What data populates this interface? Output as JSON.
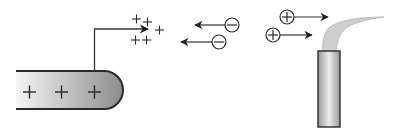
{
  "diagram": {
    "colors": {
      "background": "#ffffff",
      "stroke": "#2a2a2a",
      "rod_gradient_light": "#f4f4f4",
      "rod_gradient_dark": "#8c8c8c",
      "tube_light": "#e6e6e6",
      "tube_dark": "#9a9a9a",
      "plume_fill": "#cfcfcf"
    },
    "electrode": {
      "label": "charged electrode",
      "charges": [
        "+",
        "+",
        "+"
      ]
    },
    "emitted_charges": {
      "label": "positive charge cluster",
      "symbols": [
        "+",
        "+",
        "+",
        "+",
        "+",
        "+"
      ]
    },
    "negative_ions": [
      {
        "symbol": "−",
        "direction": "left"
      },
      {
        "symbol": "−",
        "direction": "left"
      }
    ],
    "positive_ions": [
      {
        "symbol": "+",
        "direction": "right"
      },
      {
        "symbol": "+",
        "direction": "right"
      }
    ],
    "emitter": {
      "label": "emitter tube with plume"
    }
  }
}
